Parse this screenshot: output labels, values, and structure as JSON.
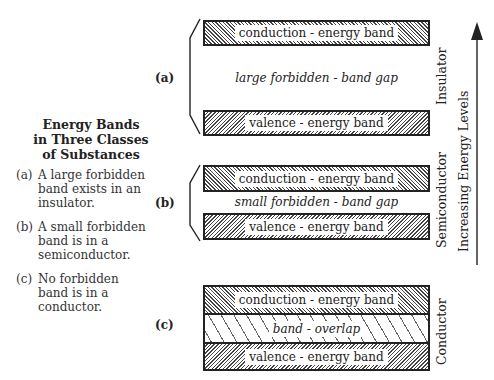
{
  "title": {
    "line1": "Energy Bands",
    "line2": "in Three Classes",
    "line3": "of Substances"
  },
  "statements": [
    {
      "tag": "(a)",
      "lines": [
        "A large forbidden",
        "band exists in an",
        "insulator."
      ]
    },
    {
      "tag": "(b)",
      "lines": [
        "A small forbidden",
        "band is in a",
        "semiconductor."
      ]
    },
    {
      "tag": "(c)",
      "lines": [
        "No forbidden",
        "band is in a",
        "conductor."
      ]
    }
  ],
  "panels": [
    {
      "label": "(a)",
      "material": "Insulator",
      "conduction": "conduction - energy band",
      "gap": "large forbidden - band gap",
      "valence": "valence - energy band"
    },
    {
      "label": "(b)",
      "material": "Semiconductor",
      "conduction": "conduction - energy band",
      "gap": "small forbidden - band gap",
      "valence": "valence - energy band"
    },
    {
      "label": "(c)",
      "material": "Conductor",
      "conduction": "conduction - energy band",
      "overlap": "band - overlap",
      "valence": "valence - energy band"
    }
  ],
  "axis": {
    "label": "Increasing Energy Levels",
    "icon": "arrow-up-icon"
  }
}
